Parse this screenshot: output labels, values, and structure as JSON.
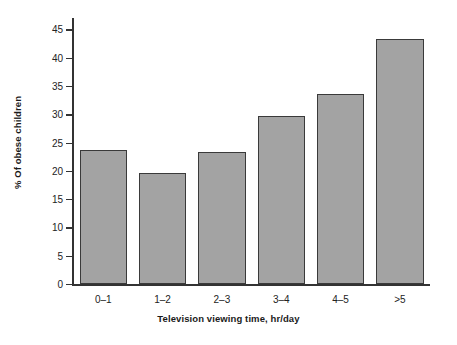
{
  "chart_data": {
    "type": "bar",
    "title": "",
    "subtitle": "",
    "xlabel": "Television viewing time, hr/day",
    "ylabel": "% Of obese children",
    "categories": [
      "0–1",
      "1–2",
      "2–3",
      "3–4",
      "4–5",
      ">5"
    ],
    "values": [
      23.6,
      19.7,
      23.4,
      29.6,
      33.5,
      43.3
    ],
    "ylim": [
      0,
      47
    ],
    "yticks": [
      0,
      5,
      10,
      15,
      20,
      25,
      30,
      35,
      40,
      45
    ],
    "ytick_labels": [
      "0",
      "5",
      "10",
      "15",
      "20",
      "25",
      "30",
      "35",
      "40",
      "45"
    ],
    "grid": false,
    "legend": null,
    "legend_position": "none",
    "series": [
      {
        "name": "% Of obese children",
        "values": [
          23.6,
          19.7,
          23.4,
          29.6,
          33.5,
          43.3
        ]
      }
    ],
    "colors": {
      "bar_fill": "#a3a3a3",
      "bar_edge": "#3a3a3a",
      "axis": "#333333",
      "text": "#232323",
      "background": "#ffffff"
    }
  }
}
